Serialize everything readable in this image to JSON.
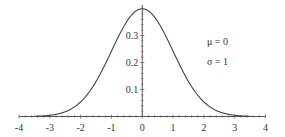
{
  "chart_data": {
    "type": "line",
    "title": "",
    "xlabel": "",
    "ylabel": "",
    "function": "normal probability density function",
    "xlim": [
      -4,
      4
    ],
    "ylim": [
      0,
      0.4
    ],
    "grid": false,
    "x_ticks": [
      "-4",
      "-3",
      "-2",
      "-1",
      "0",
      "1",
      "2",
      "3",
      "4"
    ],
    "y_ticks": [
      "0.1",
      "0.2",
      "0.3"
    ],
    "annotations": [
      "μ = 0",
      "σ = 1"
    ],
    "series": [
      {
        "name": "N(0,1) density",
        "x": [
          -4,
          -3.5,
          -3,
          -2.5,
          -2,
          -1.5,
          -1,
          -0.5,
          0,
          0.5,
          1,
          1.5,
          2,
          2.5,
          3,
          3.5,
          4
        ],
        "values": [
          0.0001,
          0.0009,
          0.0044,
          0.0175,
          0.054,
          0.1295,
          0.242,
          0.3521,
          0.3989,
          0.3521,
          0.242,
          0.1295,
          0.054,
          0.0175,
          0.0044,
          0.0009,
          0.0001
        ]
      }
    ]
  },
  "labels": {
    "mu": "μ = 0",
    "sigma": "σ = 1",
    "x": [
      "-4",
      "-3",
      "-2",
      "-1",
      "0",
      "1",
      "2",
      "3",
      "4"
    ],
    "y": [
      "0.1",
      "0.2",
      "0.3"
    ]
  }
}
